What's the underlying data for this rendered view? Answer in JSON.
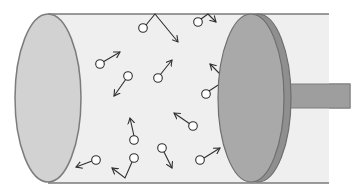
{
  "diagram": {
    "colors": {
      "background": "#ffffff",
      "cylinder_body": "#efefef",
      "cylinder_outline": "#7a7a7a",
      "end_cap_fill": "#d2d2d2",
      "end_cap_stroke": "#7c7c7c",
      "piston_face": "#a9a9a9",
      "piston_rim": "#8f8f8f",
      "piston_stroke": "#6e6e6e",
      "rod_fill": "#9e9e9e",
      "rod_stroke": "#7e7e7e",
      "molecule_stroke": "#2e2e2e",
      "molecule_fill": "#ffffff"
    },
    "cylinder": {
      "top_y": 14,
      "bottom_y": 183,
      "left_x": 48,
      "right_x": 329
    },
    "end_cap": {
      "cx": 48,
      "cy": 98,
      "rx": 33,
      "ry": 84
    },
    "piston": {
      "cx": 251,
      "cy": 98,
      "rx": 33,
      "ry": 84,
      "rim_offset": 7
    },
    "rod": {
      "x": 283,
      "y": 84,
      "width": 67,
      "height": 24
    },
    "molecules": [
      {
        "cx": 143,
        "cy": 28,
        "path": [
          [
            146,
            25
          ],
          [
            155,
            14
          ],
          [
            178,
            42
          ]
        ]
      },
      {
        "cx": 198,
        "cy": 22,
        "path": [
          [
            201,
            19
          ],
          [
            208,
            14
          ],
          [
            216,
            22
          ]
        ]
      },
      {
        "cx": 100,
        "cy": 64,
        "path": [
          [
            103,
            62
          ],
          [
            120,
            52
          ]
        ]
      },
      {
        "cx": 128,
        "cy": 76,
        "path": [
          [
            126,
            79
          ],
          [
            114,
            96
          ]
        ]
      },
      {
        "cx": 158,
        "cy": 78,
        "path": [
          [
            160,
            75
          ],
          [
            172,
            60
          ]
        ]
      },
      {
        "cx": 206,
        "cy": 94,
        "path": [
          [
            209,
            91
          ],
          [
            226,
            80
          ],
          [
            210,
            64
          ]
        ]
      },
      {
        "cx": 193,
        "cy": 126,
        "path": [
          [
            190,
            124
          ],
          [
            174,
            113
          ]
        ]
      },
      {
        "cx": 134,
        "cy": 140,
        "path": [
          [
            134,
            136
          ],
          [
            130,
            118
          ]
        ]
      },
      {
        "cx": 96,
        "cy": 160,
        "path": [
          [
            92,
            161
          ],
          [
            76,
            167
          ]
        ]
      },
      {
        "cx": 134,
        "cy": 158,
        "path": [
          [
            132,
            162
          ],
          [
            125,
            178
          ],
          [
            112,
            168
          ]
        ]
      },
      {
        "cx": 162,
        "cy": 148,
        "path": [
          [
            164,
            152
          ],
          [
            172,
            168
          ]
        ]
      },
      {
        "cx": 200,
        "cy": 160,
        "path": [
          [
            204,
            158
          ],
          [
            220,
            148
          ]
        ]
      }
    ]
  }
}
